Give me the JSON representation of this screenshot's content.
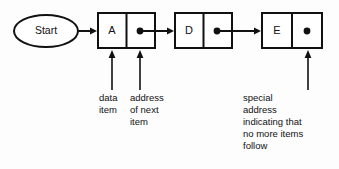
{
  "diagram": {
    "colors": {
      "background": "#fdfdfd",
      "stroke": "#111111",
      "node_fill": "#ffffff"
    },
    "start": {
      "label": "Start",
      "shape": "ellipse"
    },
    "nodes": [
      {
        "data_label": "A",
        "pointer": "dot",
        "has_next": true
      },
      {
        "data_label": "D",
        "pointer": "dot",
        "has_next": true
      },
      {
        "data_label": "E",
        "pointer": "dot",
        "has_next": false
      }
    ],
    "callouts": {
      "data_item": [
        "data",
        "item"
      ],
      "address_of_next": [
        "address",
        "of next",
        "item"
      ],
      "special_address": [
        "special",
        "address",
        "indicating that",
        "no more items",
        "follow"
      ]
    }
  }
}
